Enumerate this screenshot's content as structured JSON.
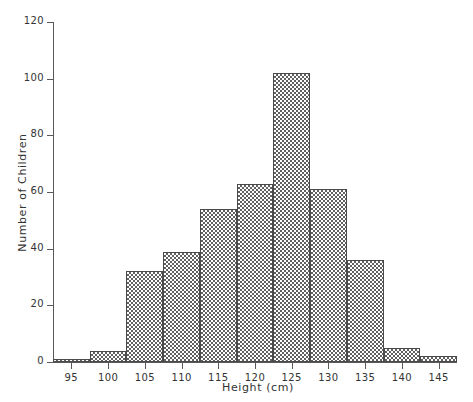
{
  "chart_data": {
    "type": "bar",
    "title": "",
    "xlabel": "Height (cm)",
    "ylabel": "Number of Children",
    "categories": [
      "95",
      "100",
      "105",
      "110",
      "115",
      "120",
      "125",
      "130",
      "135",
      "140",
      "145"
    ],
    "values": [
      1,
      4,
      32,
      39,
      54,
      63,
      102,
      61,
      36,
      5,
      2
    ],
    "bin_width": 5,
    "bin_edges": [
      92.5,
      97.5,
      102.5,
      107.5,
      112.5,
      117.5,
      122.5,
      127.5,
      132.5,
      137.5,
      142.5,
      147.5
    ],
    "xlim": [
      92.5,
      147.5
    ],
    "ylim": [
      0,
      120
    ],
    "xticks": [
      "95",
      "100",
      "105",
      "110",
      "115",
      "120",
      "125",
      "130",
      "135",
      "140",
      "145"
    ],
    "yticks": [
      "0",
      "20",
      "40",
      "60",
      "80",
      "100",
      "120"
    ],
    "grid": false,
    "legend": null,
    "bar_fill": "#606060",
    "bar_edge": "#4a4a4a",
    "axis_color": "#595959",
    "background": "#ffffff"
  }
}
